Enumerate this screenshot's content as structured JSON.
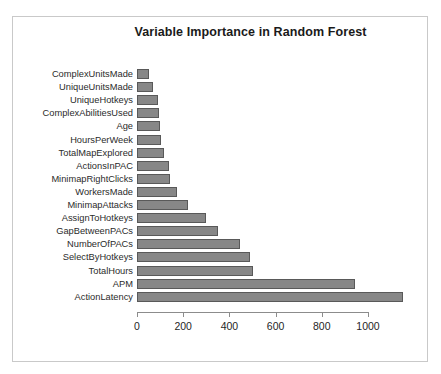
{
  "chart_data": {
    "type": "bar",
    "orientation": "horizontal",
    "title": "Variable Importance in Random Forest",
    "xlabel": "",
    "ylabel": "",
    "xlim": [
      0,
      1150
    ],
    "grid": false,
    "legend": null,
    "xticks": [
      0,
      200,
      400,
      600,
      800,
      1000
    ],
    "xtick_labels": [
      "0",
      "200",
      "400",
      "600",
      "800",
      "1000"
    ],
    "categories": [
      "ComplexUnitsMade",
      "UniqueUnitsMade",
      "UniqueHotkeys",
      "ComplexAbilitiesUsed",
      "Age",
      "HoursPerWeek",
      "TotalMapExplored",
      "ActionsInPAC",
      "MinimapRightClicks",
      "WorkersMade",
      "MinimapAttacks",
      "AssignToHotkeys",
      "GapBetweenPACs",
      "NumberOfPACs",
      "SelectByHotkeys",
      "TotalHours",
      "APM",
      "ActionLatency"
    ],
    "values": [
      50,
      70,
      90,
      95,
      100,
      105,
      115,
      140,
      145,
      175,
      220,
      300,
      350,
      445,
      490,
      500,
      945,
      1150
    ],
    "bar_color": "#878787",
    "bar_border_color": "#595959",
    "axis_color": "#8c8c8c",
    "frame_color": "#c9c9c9"
  }
}
